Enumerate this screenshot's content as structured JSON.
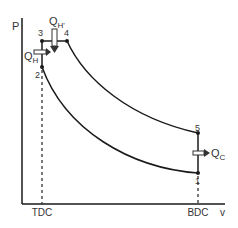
{
  "diagram": {
    "type": "P-v diagram (thermodynamic cycle)",
    "axes": {
      "y_label": "P",
      "x_label": "v"
    },
    "x_ticks": [
      {
        "label": "TDC"
      },
      {
        "label": "BDC"
      }
    ],
    "points": [
      {
        "id": "1",
        "label": "1"
      },
      {
        "id": "2",
        "label": "2"
      },
      {
        "id": "3",
        "label": "3"
      },
      {
        "id": "4",
        "label": "4"
      },
      {
        "id": "5",
        "label": "5"
      }
    ],
    "heat_flows": {
      "qh": {
        "base": "Q",
        "sub": "H",
        "direction": "in"
      },
      "qh_prime": {
        "base": "Q",
        "sub": "H'",
        "direction": "in"
      },
      "qc": {
        "base": "Q",
        "sub": "C",
        "direction": "out"
      }
    },
    "colors": {
      "line": "#1a1a1a",
      "text": "#333333",
      "background": "#ffffff"
    }
  }
}
